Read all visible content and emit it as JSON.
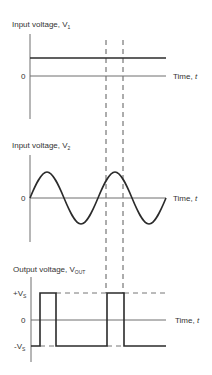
{
  "diagram": {
    "colors": {
      "signal": "#2b2b2b",
      "axis": "#6e6e6e",
      "background": "#ffffff"
    },
    "panels": [
      {
        "id": "v1",
        "title": "Input voltage, V",
        "title_sub": "1",
        "zero_label": "0",
        "time_label": "Time, ",
        "time_var": "t",
        "signal": "constant positive DC level"
      },
      {
        "id": "v2",
        "title": "Input voltage, V",
        "title_sub": "2",
        "zero_label": "0",
        "time_label": "Time, ",
        "time_var": "t",
        "signal": "sine wave, ~2 cycles"
      },
      {
        "id": "vout",
        "title": "Output voltage, V",
        "title_sub": "OUT",
        "pos_label": "+V",
        "pos_sub": "S",
        "zero_label": "0",
        "neg_label": "-V",
        "neg_sub": "S",
        "time_label": "Time, ",
        "time_var": "t",
        "signal": "square pulses at +Vs when V2 > V1, else -Vs"
      }
    ],
    "guides": "two vertical dashed lines marking where V2 exceeds V1"
  }
}
